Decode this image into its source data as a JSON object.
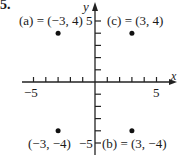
{
  "problem_number": "5.",
  "chart_data": {
    "type": "scatter",
    "title": "",
    "xlabel": "x",
    "ylabel": "y",
    "xlim": [
      -5,
      5
    ],
    "ylim": [
      -5,
      5
    ],
    "grid": false,
    "x_tick_labels": [
      "-5",
      "5"
    ],
    "y_tick_labels": [
      "5",
      "-5"
    ],
    "points": [
      {
        "label": "(a) = (−3, 4)",
        "x": -3,
        "y": 4
      },
      {
        "label": "(c) = (3, 4)",
        "x": 3,
        "y": 4
      },
      {
        "label": "(−3, −4)",
        "x": -3,
        "y": -4
      },
      {
        "label": "(b) = (3, −4)",
        "x": 3,
        "y": -4
      }
    ]
  },
  "axis": {
    "x_label": "x",
    "y_label": "y",
    "x_min_label": "−5",
    "x_max_label": "5",
    "y_max_label": "5",
    "y_min_label": "−5"
  }
}
